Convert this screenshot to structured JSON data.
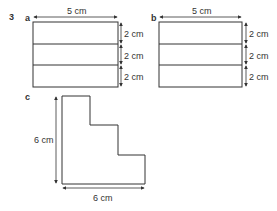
{
  "question_number": "3",
  "parts": {
    "a": {
      "label": "a",
      "width_label": "5 cm",
      "row_labels": [
        "2 cm",
        "2 cm",
        "2 cm"
      ]
    },
    "b": {
      "label": "b",
      "width_label": "5 cm",
      "row_labels": [
        "2 cm",
        "2 cm",
        "2 cm"
      ]
    },
    "c": {
      "label": "c",
      "height_label": "6 cm",
      "width_label": "6 cm"
    }
  },
  "colors": {
    "line": "#333333",
    "text": "#333333"
  }
}
